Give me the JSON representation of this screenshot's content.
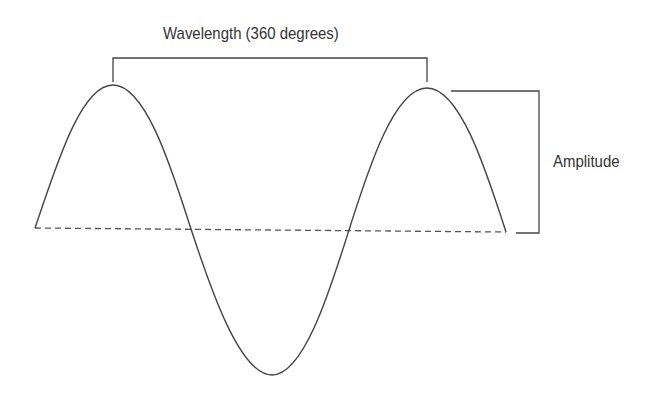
{
  "diagram": {
    "labels": {
      "wavelength": "Wavelength (360 degrees)",
      "amplitude": "Amplitude"
    },
    "colors": {
      "stroke": "#444444",
      "text": "#333333",
      "background": "#ffffff"
    },
    "wave": {
      "start": [
        35,
        228
      ],
      "peak1": [
        113,
        85
      ],
      "cross1": [
        191,
        229
      ],
      "trough": [
        272,
        375
      ],
      "cross2": [
        349,
        230
      ],
      "peak2": [
        427,
        88
      ],
      "end": [
        506,
        232
      ]
    },
    "baseline": {
      "style": "dashed",
      "from": [
        35,
        228
      ],
      "to": [
        506,
        232
      ]
    },
    "wavelength_bracket": {
      "from_x": 113,
      "to_x": 427,
      "top_y": 58
    },
    "amplitude_bracket": {
      "top_y": 91,
      "bottom_y": 233,
      "x": 539
    }
  }
}
